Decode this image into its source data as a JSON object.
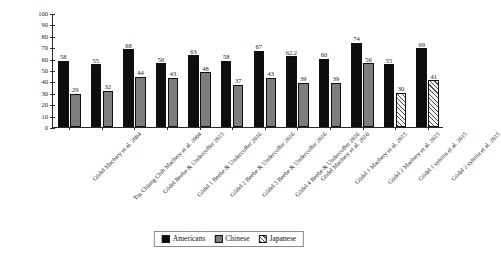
{
  "chart_data": {
    "type": "bar",
    "title": "",
    "subtitle": "",
    "xlabel": "",
    "ylabel": "",
    "ylim": [
      0,
      100
    ],
    "yticks": [
      0,
      10,
      20,
      30,
      40,
      50,
      60,
      70,
      80,
      90,
      100
    ],
    "grid": false,
    "legend_position": "bottom-center",
    "categories": [
      "Gödel Machery et al. 2004",
      "Tsu Chiung Chih Machery et al. 2004",
      "Gödel Beebe & Undercoffer 2015",
      "Gödel 1 Beebe & Undercoffer 2016",
      "Gödel 2 Beebe & Undercoffer 2016",
      "Gödel 3 Beebe & Undercoffer 2016",
      "Gödel 4 Beebe & Undercoffer 2016",
      "Gödel Machery et al. 2010",
      "Gödel 1 Machery et al. 2015",
      "Gödel 2 Machery et al. 2015",
      "Gödel 1 sytsma et al. 2015",
      "Gödel 2 sytsma et al. 2015"
    ],
    "series": [
      {
        "name": "Americans",
        "color": "#0d0d0d",
        "values": [
          58,
          55,
          68,
          56,
          63,
          58,
          67,
          62.2,
          60,
          74,
          55,
          69
        ]
      },
      {
        "name": "Chinese",
        "color": "#7d7d7d",
        "values": [
          29,
          32,
          44,
          43,
          48,
          37,
          43,
          39,
          39,
          56,
          null,
          null
        ]
      },
      {
        "name": "Japanese",
        "color": "#f2f2f2",
        "values": [
          null,
          null,
          null,
          null,
          null,
          null,
          null,
          null,
          null,
          null,
          30,
          41
        ]
      }
    ],
    "legend": [
      "Americans",
      "Chinese",
      "Japanese"
    ]
  }
}
